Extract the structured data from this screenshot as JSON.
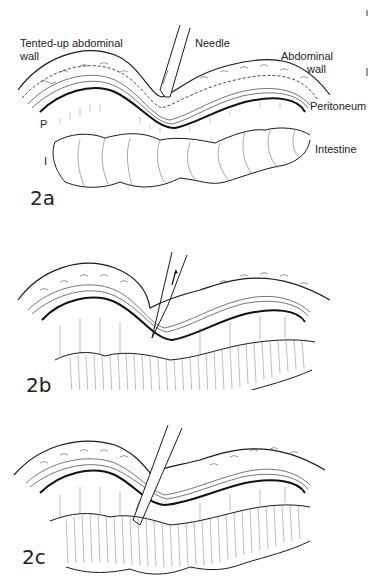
{
  "figure": {
    "panels": [
      {
        "id": "2a",
        "label": "2a",
        "annotations": {
          "tented_wall": "Tented-up abdominal",
          "tented_wall_2": "wall",
          "needle": "Needle",
          "abdominal_wall": "Abdominal",
          "abdominal_wall_2": "wall",
          "peritoneum": "Peritoneum",
          "p_marker": "P",
          "intestine": "Intestine",
          "i_marker": "I"
        }
      },
      {
        "id": "2b",
        "label": "2b"
      },
      {
        "id": "2c",
        "label": "2c"
      }
    ],
    "colors": {
      "ink": "#1a1a1a",
      "paper": "#ffffff",
      "hatch": "#555555"
    }
  }
}
